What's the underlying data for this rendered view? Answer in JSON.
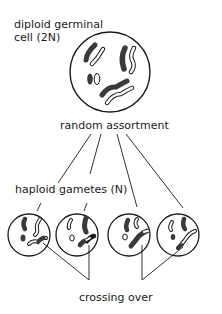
{
  "labels": {
    "diploid_line1": "diploid germinal",
    "diploid_line2": "cell (2N)",
    "random_assortment": "random assortment",
    "haploid_gametes": "haploid gametes (N)",
    "crossing_over": "crossing over"
  },
  "cells": {
    "diploid": {
      "cx": 110,
      "cy": 72,
      "r": 40,
      "ploidy": "2N"
    },
    "gametes": [
      {
        "cx": 29,
        "cy": 235,
        "r": 21,
        "ploidy": "N"
      },
      {
        "cx": 77,
        "cy": 235,
        "r": 21,
        "ploidy": "N"
      },
      {
        "cx": 129,
        "cy": 235,
        "r": 21,
        "ploidy": "N"
      },
      {
        "cx": 178,
        "cy": 235,
        "r": 21,
        "ploidy": "N"
      }
    ]
  },
  "colors": {
    "stroke": "#1a1a1a",
    "dark_chromosome": "#3a3a3a",
    "light_chromosome": "#ffffff"
  }
}
